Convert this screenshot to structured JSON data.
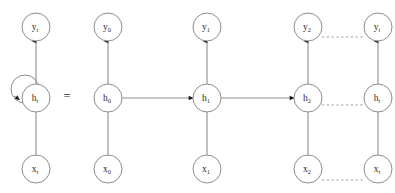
{
  "figure": {
    "equals_symbol": "=",
    "background_color": "#ffffff",
    "node_stroke_color": "#8d8d8d",
    "node_fill_color": "#ffffff",
    "edge_color": "#8d8d8d",
    "arrow_color": "#1b1b1b",
    "dotted_edge_color": "#9a9a9a",
    "label_color": "#2a2a2a"
  },
  "folded": {
    "caption": "folded recurrent cell",
    "output": {
      "base": "y",
      "sub": "t"
    },
    "hidden": {
      "base": "h",
      "sub": "t"
    },
    "input": {
      "base": "x",
      "sub": "t"
    },
    "self_loop": {
      "label": "recurrent-self-loop"
    }
  },
  "unrolled": {
    "caption": "unrolled over timesteps",
    "columns": [
      {
        "step": "0",
        "output": {
          "base": "y",
          "sub": "0"
        },
        "hidden": {
          "base": "h",
          "sub": "0"
        },
        "input": {
          "base": "x",
          "sub": "0"
        }
      },
      {
        "step": "1",
        "output": {
          "base": "y",
          "sub": "1"
        },
        "hidden": {
          "base": "h",
          "sub": "1"
        },
        "input": {
          "base": "x",
          "sub": "1"
        }
      },
      {
        "step": "2",
        "output": {
          "base": "y",
          "sub": "2"
        },
        "hidden": {
          "base": "h",
          "sub": "2"
        },
        "input": {
          "base": "x",
          "sub": "2"
        }
      },
      {
        "step": "t",
        "output": {
          "base": "y",
          "sub": "t"
        },
        "hidden": {
          "base": "h",
          "sub": "t"
        },
        "input": {
          "base": "x",
          "sub": "t"
        }
      }
    ],
    "ellipsis_rows": [
      "output-row",
      "hidden-row",
      "input-row"
    ]
  }
}
